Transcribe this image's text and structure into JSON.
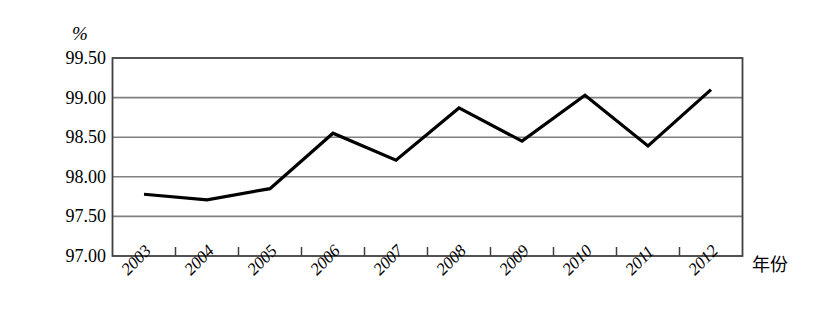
{
  "chart_data": {
    "type": "line",
    "title": "",
    "subtitle": "",
    "xlabel": "年份",
    "ylabel": "%",
    "unit_label": "%",
    "categories": [
      "2003",
      "2004",
      "2005",
      "2006",
      "2007",
      "2008",
      "2009",
      "2010",
      "2011",
      "2012"
    ],
    "series": [
      {
        "name": "",
        "values": [
          97.78,
          97.71,
          97.85,
          98.55,
          98.21,
          98.87,
          98.45,
          99.03,
          98.39,
          99.1
        ]
      }
    ],
    "ylim": [
      97.0,
      99.5
    ],
    "ytick_labels": [
      "99.50",
      "99.00",
      "98.50",
      "98.00",
      "97.50",
      "97.00"
    ],
    "ytick_values": [
      99.5,
      99.0,
      98.5,
      98.0,
      97.5,
      97.0
    ],
    "grid": true,
    "grid_orientation": "horizontal",
    "legend": "none",
    "legend_position": "none",
    "line_color": "#000000",
    "grid_color": "#808080",
    "frame_color": "#404040",
    "background_color": "#ffffff",
    "markers": false,
    "xtick_rotation": -45,
    "annotations": []
  },
  "axis": {
    "y_unit": "%",
    "x_title": "年份"
  }
}
